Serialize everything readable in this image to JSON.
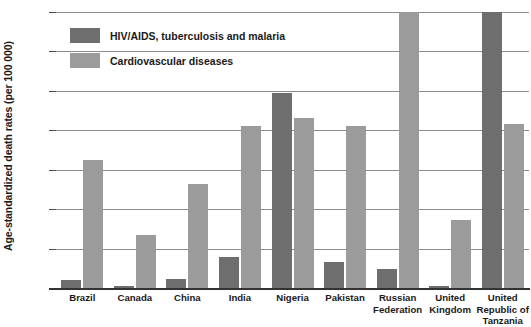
{
  "chart_data": {
    "type": "bar",
    "title": "",
    "xlabel": "",
    "ylabel": "Age-standardized death rates (per 100 000)",
    "ylim": [
      0,
      700
    ],
    "yticks": [
      0,
      100,
      200,
      300,
      400,
      500,
      600,
      700
    ],
    "ytick_labels": [
      "0",
      "100",
      "200",
      "300",
      "400",
      "500",
      "600",
      "700"
    ],
    "grid": true,
    "legend_position": "top-left",
    "categories": [
      "Brazil",
      "Canada",
      "China",
      "India",
      "Nigeria",
      "Pakistan",
      "Russian Federation",
      "United Kingdom",
      "United Republic of Tanzania"
    ],
    "category_lines": [
      [
        "Brazil"
      ],
      [
        "Canada"
      ],
      [
        "China"
      ],
      [
        "India"
      ],
      [
        "Nigeria"
      ],
      [
        "Pakistan"
      ],
      [
        "Russian",
        "Federation"
      ],
      [
        "United",
        "Kingdom"
      ],
      [
        "United",
        "Republic of",
        "Tanzania"
      ]
    ],
    "series": [
      {
        "name": "HIV/AIDS, tuberculosis and malaria",
        "color": "#6e6e6e",
        "values": [
          20,
          5,
          24,
          78,
          495,
          65,
          48,
          6,
          700
        ],
        "clipped": [
          false,
          false,
          false,
          false,
          false,
          false,
          false,
          false,
          true
        ]
      },
      {
        "name": "Cardiovascular diseases",
        "color": "#9b9b9b",
        "values": [
          325,
          134,
          265,
          410,
          430,
          410,
          700,
          172,
          415
        ],
        "clipped": [
          false,
          false,
          false,
          false,
          false,
          false,
          true,
          false,
          false
        ]
      }
    ]
  },
  "legend": {
    "entries": [
      {
        "label": "HIV/AIDS, tuberculosis and malaria",
        "swatch": "dark"
      },
      {
        "label": "Cardiovascular diseases",
        "swatch": "light"
      }
    ]
  },
  "axis": {
    "y_title": "Age-standardized death rates (per 100 000)"
  },
  "cropped_title": ""
}
